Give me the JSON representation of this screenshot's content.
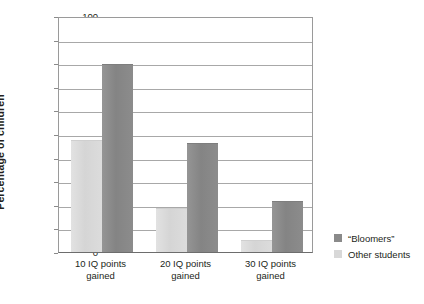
{
  "chart_data": {
    "type": "bar",
    "title": "",
    "xlabel": "",
    "ylabel": "Percentage of children",
    "categories": [
      "10 IQ points gained",
      "20 IQ points gained",
      "30 IQ points gained"
    ],
    "category_lines": [
      [
        "10 IQ points",
        "gained"
      ],
      [
        "20 IQ points",
        "gained"
      ],
      [
        "30 IQ points",
        "gained"
      ]
    ],
    "series": [
      {
        "name": "“Bloomers”",
        "values": [
          79.5,
          46,
          21.5
        ],
        "color": "#8a8a8a"
      },
      {
        "name": "Other students",
        "values": [
          47.5,
          18.5,
          5
        ],
        "color": "#d8d8d8"
      }
    ],
    "bar_order": [
      "Other students",
      "“Bloomers”"
    ],
    "ylim": [
      0,
      100
    ],
    "ytick_step": 10,
    "yticks": [
      0,
      10,
      20,
      30,
      40,
      50,
      60,
      70,
      80,
      90,
      100
    ],
    "ytick_labels": [
      "0",
      "10",
      "20",
      "30",
      "40",
      "50",
      "60",
      "70",
      "80",
      "90",
      "100"
    ],
    "grid": true,
    "grid_axis": "y",
    "legend_position": "right"
  },
  "legend": {
    "items": [
      {
        "label": "“Bloomers”",
        "color": "#8a8a8a"
      },
      {
        "label": "Other students",
        "color": "#d8d8d8"
      }
    ]
  },
  "axis": {
    "y_title": "Percentage of children"
  }
}
